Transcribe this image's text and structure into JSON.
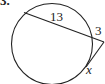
{
  "problem": {
    "number": "3."
  },
  "figure": {
    "type": "circle-secant-tangent",
    "labels": {
      "secant_internal": "13",
      "secant_external": "3",
      "tangent": "x"
    },
    "stroke_color": "#222222"
  }
}
